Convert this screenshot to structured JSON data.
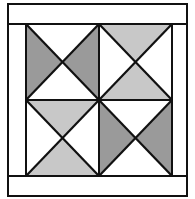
{
  "colors": {
    "background": "#ffffff",
    "outline": "#111111",
    "dark_gray": "#9a9a9a",
    "light_gray": "#c8c8c8",
    "white": "#ffffff"
  },
  "frame": {
    "outer": {
      "x": 8,
      "y": 4,
      "w": 179,
      "h": 192
    },
    "inner": {
      "x": 26,
      "y": 24,
      "w": 146,
      "h": 152
    }
  },
  "center": {
    "x": 99,
    "y": 100
  },
  "quadrants": [
    {
      "name": "top-left",
      "shaded": [
        "left",
        "right"
      ],
      "shade": "dark_gray"
    },
    {
      "name": "top-right",
      "shaded": [
        "top",
        "bottom"
      ],
      "shade": "light_gray"
    },
    {
      "name": "bottom-left",
      "shaded": [
        "top",
        "bottom"
      ],
      "shade": "light_gray"
    },
    {
      "name": "bottom-right",
      "shaded": [
        "left",
        "right"
      ],
      "shade": "dark_gray"
    }
  ]
}
